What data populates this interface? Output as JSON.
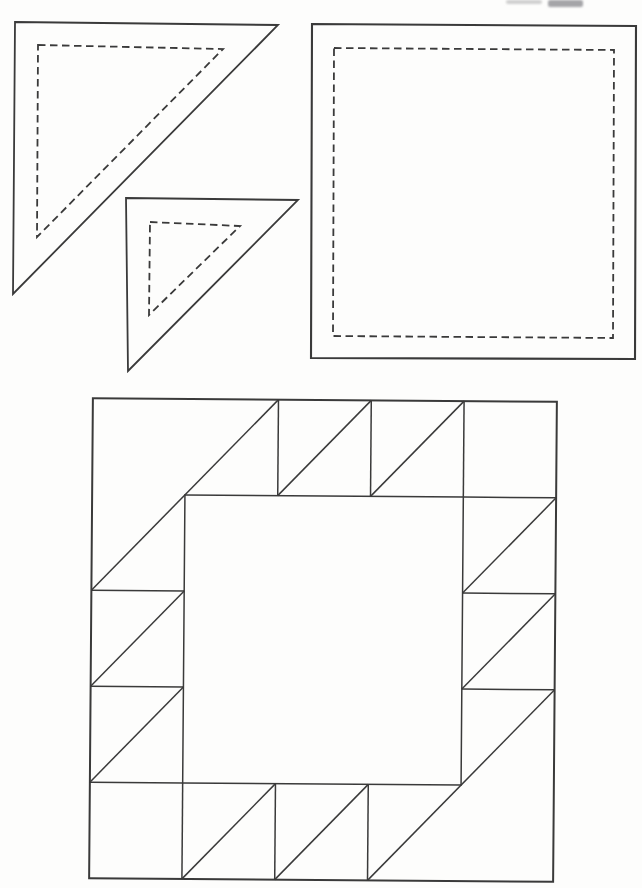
{
  "meta": {
    "background": "#fdfdfc",
    "ink": "#3a3a3a"
  },
  "artifact": {
    "description": "faint cut-off print fragment at top page edge"
  },
  "templates": [
    {
      "id": "large-triangle-template",
      "kind": "half-square-triangle",
      "solid_outline": "15,22 278,25 13,294",
      "dashed_seam": "38,45 223,49 37,237"
    },
    {
      "id": "small-triangle-template",
      "kind": "half-square-triangle",
      "solid_outline": "126,198 298,200 128,371",
      "dashed_seam": "150,222 240,226 149,315"
    },
    {
      "id": "square-template",
      "kind": "square",
      "solid_outline": "312,24 636,26 635,359 311,358",
      "dashed_seam": "334,48 614,50 613,338 333,336"
    }
  ],
  "block": {
    "id": "quilt-block-diagram",
    "left": 91,
    "top": 400,
    "right": 555,
    "bottom": 880,
    "cols": 5,
    "rows": 5,
    "tilt_deg": 0.45,
    "outer_rect": [
      0,
      0,
      5,
      5
    ],
    "inner_rect": [
      1,
      1,
      4,
      4
    ],
    "segments": [
      [
        2,
        0,
        2,
        1
      ],
      [
        3,
        0,
        3,
        1
      ],
      [
        4,
        0,
        4,
        1
      ],
      [
        4,
        1,
        5,
        1
      ],
      [
        4,
        2,
        5,
        2
      ],
      [
        4,
        3,
        5,
        3
      ],
      [
        0,
        2,
        1,
        2
      ],
      [
        0,
        3,
        1,
        3
      ],
      [
        0,
        4,
        1,
        4
      ],
      [
        1,
        4,
        1,
        5
      ],
      [
        2,
        4,
        2,
        5
      ],
      [
        3,
        4,
        3,
        5
      ],
      [
        2,
        0,
        0,
        2
      ],
      [
        5,
        3,
        3,
        5
      ],
      [
        2,
        1,
        3,
        0
      ],
      [
        3,
        1,
        4,
        0
      ],
      [
        4,
        2,
        5,
        1
      ],
      [
        4,
        3,
        5,
        2
      ],
      [
        0,
        3,
        1,
        2
      ],
      [
        0,
        4,
        1,
        3
      ],
      [
        1,
        5,
        2,
        4
      ],
      [
        2,
        5,
        3,
        4
      ]
    ]
  }
}
